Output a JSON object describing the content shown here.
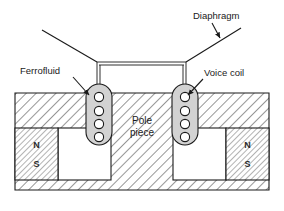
{
  "figure": {
    "background_color": "#ffffff",
    "line_color": "#1a1a1a"
  },
  "labels": {
    "diaphragm": "Diaphragm",
    "ferrofluid": "Ferrofluid",
    "voice_coil": "Voice coil",
    "pole_piece_line1": "Pole",
    "pole_piece_line2": "piece"
  },
  "magnets": {
    "left": {
      "north": "N",
      "south": "S"
    },
    "right": {
      "north": "N",
      "south": "S"
    }
  },
  "colors": {
    "ferrofluid_fill": "#d2d2d2",
    "coil_fill": "#ffffff",
    "hatch_stroke": "#4a4a4a",
    "magnet_hatch_stroke": "#6a6a6a",
    "outline": "#1a1a1a",
    "page": "#ffffff"
  },
  "parts": {
    "housing": "yoke-hatched-body",
    "air_gap_left": "air-gap",
    "air_gap_right": "air-gap",
    "coil_turns_per_side": 4
  }
}
